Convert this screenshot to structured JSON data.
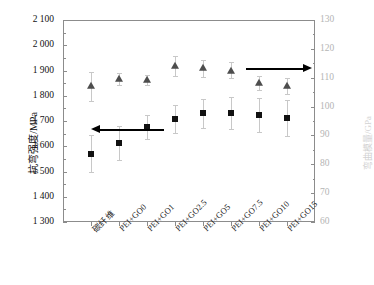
{
  "chart_data": {
    "type": "scatter",
    "title": "",
    "categories": [
      "碳纤维",
      "PEI+GO0",
      "PEI+GO1",
      "PEI+GO2.5",
      "PEI+GO5",
      "PEI+GO7.5",
      "PEI+GO10",
      "PEI+GO15"
    ],
    "xlabel": "",
    "ylabel": "抗弯强度/MPa",
    "ylabel_right": "弯曲模量/GPa",
    "ylim": [
      1300,
      2100
    ],
    "ylim_right": [
      60,
      130
    ],
    "yticks": [
      "1 300",
      "1 400",
      "1 500",
      "1 600",
      "1 700",
      "1 800",
      "1 900",
      "2 000",
      "2 100"
    ],
    "yticks_right": [
      "60",
      "70",
      "80",
      "90",
      "100",
      "110",
      "120",
      "130"
    ],
    "grid": false,
    "legend_position": "none",
    "series": [
      {
        "name": "抗弯强度",
        "axis": "left",
        "marker": "square",
        "color": "#111111",
        "values": [
          1570,
          1612,
          1675,
          1707,
          1730,
          1731,
          1722,
          1711
        ],
        "err_low": [
          1498,
          1545,
          1628,
          1651,
          1672,
          1668,
          1655,
          1640
        ],
        "err_high": [
          1644,
          1680,
          1722,
          1764,
          1789,
          1795,
          1790,
          1782
        ]
      },
      {
        "name": "弯曲模量",
        "axis": "right",
        "marker": "triangle",
        "color": "#4d4d4d",
        "values": [
          1838,
          1866,
          1862,
          1919,
          1908,
          1900,
          1849,
          1840
        ],
        "err_low": [
          1778,
          1843,
          1842,
          1880,
          1876,
          1871,
          1821,
          1808
        ],
        "err_high": [
          1895,
          1889,
          1884,
          1956,
          1940,
          1932,
          1879,
          1872
        ]
      }
    ],
    "annotations": [
      {
        "name": "left-arrow",
        "direction": "left",
        "y_value": 1668,
        "x_start_cat": 0,
        "x_end_cat": 2.6
      },
      {
        "name": "right-arrow",
        "direction": "right",
        "y_value": 1908,
        "x_start_cat": 5.55,
        "x_end_cat": 7.9
      }
    ]
  }
}
